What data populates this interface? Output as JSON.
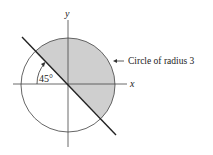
{
  "figure": {
    "axis_labels": {
      "x": "x",
      "y": "y"
    },
    "angle_label": "45°",
    "circle_label": "Circle of radius 3",
    "colors": {
      "shade": "#cfcfcf",
      "line": "#222222",
      "circle": "#555555",
      "background": "#ffffff"
    }
  }
}
